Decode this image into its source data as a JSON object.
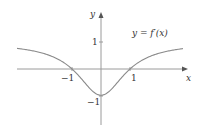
{
  "chart_data": {
    "type": "line",
    "title": "",
    "curve_label": "y = f′(x)",
    "xlabel": "x",
    "ylabel": "y",
    "x_ticks": [
      {
        "value": -1,
        "label": "−1"
      },
      {
        "value": 1,
        "label": "1"
      }
    ],
    "y_ticks": [
      {
        "value": 1,
        "label": "1"
      },
      {
        "value": -1,
        "label": "−1"
      }
    ],
    "xlim": [
      -2.9,
      3.0
    ],
    "ylim": [
      -2.1,
      2.1
    ],
    "grid": false,
    "legend": "none",
    "series": [
      {
        "name": "f'(x)",
        "x": [
          -2.9,
          -2.5,
          -2.0,
          -1.5,
          -1.0,
          -0.5,
          0.0,
          0.5,
          1.0,
          1.5,
          2.0,
          2.5,
          2.9
        ],
        "values": [
          0.79,
          0.72,
          0.6,
          0.38,
          0.0,
          -0.6,
          -1.0,
          -0.6,
          0.0,
          0.38,
          0.6,
          0.72,
          0.79
        ]
      }
    ]
  },
  "colors": {
    "axis": "#9a9a9a",
    "curve": "#8a8a8a",
    "text": "#333333"
  }
}
